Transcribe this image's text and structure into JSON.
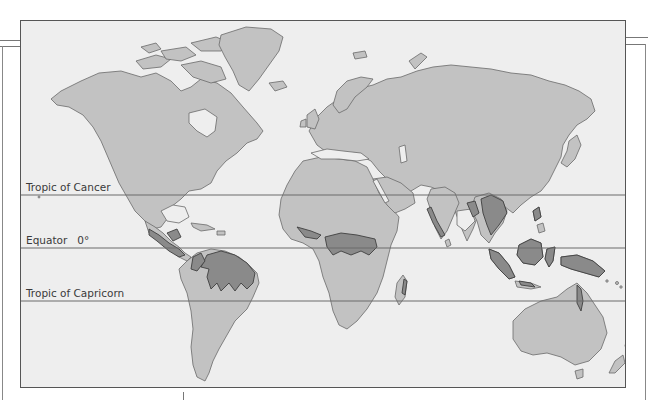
{
  "map": {
    "type": "world-map",
    "subject": "tropical rainforest distribution",
    "colors": {
      "ocean": "#eeeeee",
      "land": "#c2c2c2",
      "land_outline": "#6a6a6a",
      "rainforest": "#8a8a8a",
      "rainforest_outline": "#3f3f3f",
      "latitude_line": "#6a6a6a",
      "frame": "#555555"
    },
    "latitude_lines": [
      {
        "label": "Tropic of Cancer",
        "y": 174
      },
      {
        "label": "Equator   0°",
        "y": 227
      },
      {
        "label": "Tropic of Capricorn",
        "y": 280
      }
    ],
    "regions_highlighted": [
      "Central America",
      "Amazon Basin",
      "West & Central Africa",
      "Madagascar (east coast)",
      "India (west coast)",
      "Southeast Asia",
      "Indonesia",
      "New Guinea",
      "Northeast Australia"
    ]
  }
}
